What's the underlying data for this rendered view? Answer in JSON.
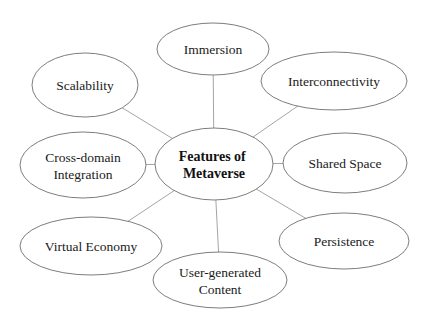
{
  "diagram": {
    "type": "mind-map",
    "center": {
      "id": "features-of-metaverse",
      "lines": [
        "Features of",
        "Metaverse"
      ],
      "cx": 214,
      "cy": 164,
      "rx": 59,
      "ry": 36
    },
    "nodes": [
      {
        "id": "immersion",
        "lines": [
          "Immersion"
        ],
        "cx": 213,
        "cy": 49,
        "rx": 56,
        "ry": 26
      },
      {
        "id": "interconnectivity",
        "lines": [
          "Interconnectivity"
        ],
        "cx": 334,
        "cy": 81,
        "rx": 73,
        "ry": 29
      },
      {
        "id": "shared-space",
        "lines": [
          "Shared Space"
        ],
        "cx": 345,
        "cy": 163,
        "rx": 62,
        "ry": 30
      },
      {
        "id": "persistence",
        "lines": [
          "Persistence"
        ],
        "cx": 344,
        "cy": 241,
        "rx": 65,
        "ry": 28
      },
      {
        "id": "user-generated-content",
        "lines": [
          "User-generated",
          "Content"
        ],
        "cx": 220,
        "cy": 280,
        "rx": 67,
        "ry": 28
      },
      {
        "id": "virtual-economy",
        "lines": [
          "Virtual Economy"
        ],
        "cx": 91,
        "cy": 246,
        "rx": 71,
        "ry": 29
      },
      {
        "id": "cross-domain-integration",
        "lines": [
          "Cross-domain",
          "Integration"
        ],
        "cx": 83,
        "cy": 165,
        "rx": 63,
        "ry": 33
      },
      {
        "id": "scalability",
        "lines": [
          "Scalability"
        ],
        "cx": 85,
        "cy": 85,
        "rx": 53,
        "ry": 32
      }
    ],
    "colors": {
      "background": "#ffffff",
      "node_stroke": "#6e6e6e",
      "edge_stroke": "#9a9a9a",
      "text": "#1a1a1a"
    }
  }
}
